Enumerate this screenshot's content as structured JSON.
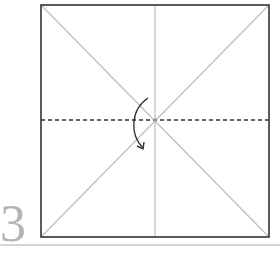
{
  "step": {
    "number": "3"
  },
  "diagram": {
    "paper": {
      "x": 41,
      "y": 5,
      "size": 229,
      "border_color": "#333333"
    },
    "crease_color": "#b8b8b8",
    "fold_line": {
      "type": "valley",
      "style": "dashed",
      "color": "#333333"
    },
    "arrow": {
      "direction": "fold-down",
      "color": "#333333"
    }
  }
}
